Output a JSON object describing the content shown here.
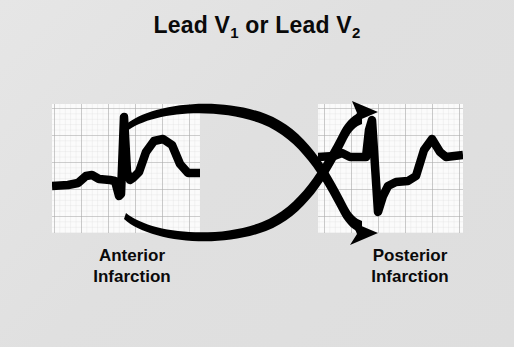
{
  "figure": {
    "title_prefix": "Lead V",
    "title_sub1": "1",
    "title_middle": " or Lead V",
    "title_sub2": "2",
    "title_full": "Lead V1 or Lead V2",
    "background_color": "#e0e0e0",
    "trace_color": "#000000",
    "grid_minor_color": "#d8d8d8",
    "grid_major_color": "#a8a8a8",
    "grid_paper_color": "#fbfbfb"
  },
  "panels": [
    {
      "id": "anterior",
      "caption": "Anterior\nInfarction",
      "caption_line1": "Anterior",
      "caption_line2": "Infarction",
      "grid": {
        "x": 52,
        "y": 104,
        "width": 148,
        "height": 129,
        "minor_step": 5.4,
        "major_every": 5
      },
      "waveform_description": "Baseline with small P wave, small Q dip, tall narrow R spike, deep narrow S, elevated ST segment and broad dome-shaped T wave returning to baseline",
      "features": [
        "P wave",
        "Q wave",
        "tall R wave",
        "S wave",
        "ST elevation",
        "broad upright T wave"
      ]
    },
    {
      "id": "posterior",
      "caption": "Posterior\nInfarction",
      "caption_line1": "Posterior",
      "caption_line2": "Infarction",
      "grid": {
        "x": 318,
        "y": 104,
        "width": 145,
        "height": 129,
        "minor_step": 5.4,
        "major_every": 5
      },
      "waveform_description": "Baseline with flat segment, tall narrow R spike descending to deep S wave, depressed ST segment rising to an upward peak then stepping down to baseline",
      "features": [
        "flat baseline",
        "tall R wave",
        "deep S wave",
        "ST depression",
        "terminal upright deflection"
      ]
    }
  ],
  "arrows": [
    {
      "id": "upper-crossing-arrow",
      "from_panel": "anterior",
      "to_panel": "posterior",
      "description": "Thin-to-thick tapered curve starting inside the left grid near the T wave, arcing upward to the right and ending in an arrowhead at the top of the right grid"
    },
    {
      "id": "lower-crossing-arrow",
      "from_panel": "anterior",
      "to_panel": "posterior",
      "description": "Thin-to-thick tapered curve starting inside the left grid below the baseline, arcing downward to the right and ending in an arrowhead at the bottom of the right grid"
    }
  ]
}
